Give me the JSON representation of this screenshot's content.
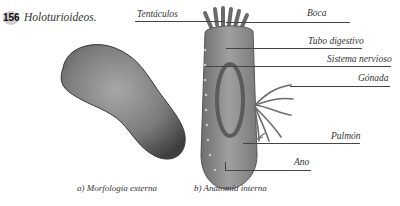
{
  "figure": {
    "number": "156",
    "title": "Holoturioideos."
  },
  "labels": {
    "tentaculos": "Tentáculos",
    "boca": "Boca",
    "tubo_digestivo": "Tubo digestivo",
    "sistema_nervioso": "Sistema nervioso",
    "gonada": "Gónada",
    "pulmon": "Pulmón",
    "ano": "Ano"
  },
  "captions": {
    "a": "a) Morfología externa",
    "b": "b) Anatomía interna"
  },
  "colors": {
    "body_dark": "#4a4a4a",
    "body_light": "#9a9a9a",
    "section_fill": "#8c8c8c",
    "line": "#444444"
  }
}
